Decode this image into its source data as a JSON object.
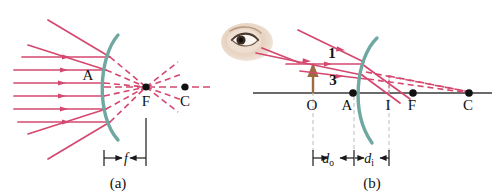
{
  "figure": {
    "background_color": "#ffffff",
    "width": 499,
    "height": 196,
    "panels": [
      {
        "id": "a",
        "caption": "(a)",
        "caption_x": 118,
        "caption_y": 188,
        "description": "Parallel rays reflecting from a concave mirror converge at the focal point F",
        "point_labels": [
          {
            "name": "A",
            "text": "A",
            "x": 88,
            "y": 80,
            "dot": false
          },
          {
            "name": "F",
            "text": "F",
            "x": 146,
            "y": 106,
            "dot": true,
            "dot_x": 146,
            "dot_y": 87
          },
          {
            "name": "C",
            "text": "C",
            "x": 185,
            "y": 106,
            "dot": true,
            "dot_x": 185,
            "dot_y": 87
          }
        ],
        "dimension": {
          "label": "f",
          "label_x": 133,
          "label_y": 163,
          "from_x": 104,
          "to_x": 146,
          "y": 158
        }
      },
      {
        "id": "b",
        "caption": "(b)",
        "caption_x": 372,
        "caption_y": 188,
        "description": "Object at O forms a real inverted image at I between A and F",
        "point_labels": [
          {
            "name": "O",
            "text": "O",
            "x": 311,
            "y": 110,
            "dot": false
          },
          {
            "name": "A",
            "text": "A",
            "x": 348,
            "y": 110,
            "dot": true,
            "dot_x": 353,
            "dot_y": 93
          },
          {
            "name": "I",
            "text": "I",
            "x": 387,
            "y": 110,
            "dot": false
          },
          {
            "name": "F",
            "text": "F",
            "x": 410,
            "y": 110,
            "dot": true,
            "dot_x": 413,
            "dot_y": 93
          },
          {
            "name": "C",
            "text": "C",
            "x": 465,
            "y": 110,
            "dot": true,
            "dot_x": 469,
            "dot_y": 93
          }
        ],
        "ray_labels": [
          {
            "name": "ray-1",
            "text": "1",
            "x": 332,
            "y": 56
          },
          {
            "name": "ray-3",
            "text": "3",
            "x": 333,
            "y": 82
          }
        ],
        "dimensions": [
          {
            "name": "d-object",
            "label": "d",
            "sub": "o",
            "label_x": 331,
            "label_y": 163,
            "from_x": 313,
            "to_x": 353,
            "y": 158
          },
          {
            "name": "d-image",
            "label": "d",
            "sub": "i",
            "label_x": 371,
            "label_y": 163,
            "from_x": 355,
            "to_x": 389,
            "y": 158
          }
        ]
      }
    ],
    "colors": {
      "ray_pink": "#d4486f",
      "ray_pink_light": "#d9708d",
      "mirror_teal": "#6fa8a0",
      "axis_black": "#1a1a1a",
      "object_brown": "#9c6b3f",
      "label_black": "#111111",
      "guide_gray": "#bdbdbd",
      "skin_light": "#f0dfd2",
      "skin_mid": "#d9bda4",
      "eye_dark": "#4a3a30"
    },
    "icons": [
      {
        "name": "eye-icon",
        "x": 222,
        "y": 22,
        "width": 52,
        "height": 40,
        "description": "observer eye illustration"
      }
    ]
  }
}
